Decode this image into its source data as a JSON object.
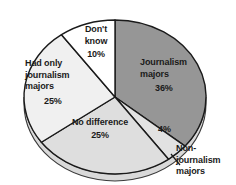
{
  "chart_data": {
    "type": "pie",
    "title": "",
    "subtitle": "",
    "xlabel": "",
    "ylabel": "",
    "legend_position": "none",
    "grid": false,
    "style": "3d-pie",
    "total": 100,
    "units": "percent",
    "categories": [
      "Journalism majors",
      "Non-journalism majors",
      "No difference",
      "Had only journalism majors",
      "Don't know"
    ],
    "values": [
      36,
      4,
      25,
      25,
      10
    ],
    "slices": [
      {
        "name": "journalism-majors",
        "label_line1": "Journalism",
        "label_line2": "majors",
        "percent_text": "36%",
        "value": 36,
        "color": "#969696",
        "label_inside": true
      },
      {
        "name": "non-journalism-majors",
        "label_line1": "Non-",
        "label_line2": "journalism",
        "label_line3": "majors",
        "percent_text": "4%",
        "value": 4,
        "color": "#e2e2e2",
        "label_inside": false
      },
      {
        "name": "no-difference",
        "label_line1": "No difference",
        "percent_text": "25%",
        "value": 25,
        "color": "#dedede",
        "label_inside": true
      },
      {
        "name": "had-only-journalism-majors",
        "label_line1": "Had only",
        "label_line2": "journalism",
        "label_line3": "majors",
        "percent_text": "25%",
        "value": 25,
        "color": "#f0f0f0",
        "label_inside": true
      },
      {
        "name": "dont-know",
        "label_line1": "Don't",
        "label_line2": "know",
        "percent_text": "10%",
        "value": 10,
        "color": "#ffffff",
        "label_inside": true
      }
    ],
    "colors": {
      "outline": "#1a1a1a",
      "text": "#1a1a1a",
      "background": "#ffffff",
      "base_shadow": "#d9d9d9"
    }
  }
}
